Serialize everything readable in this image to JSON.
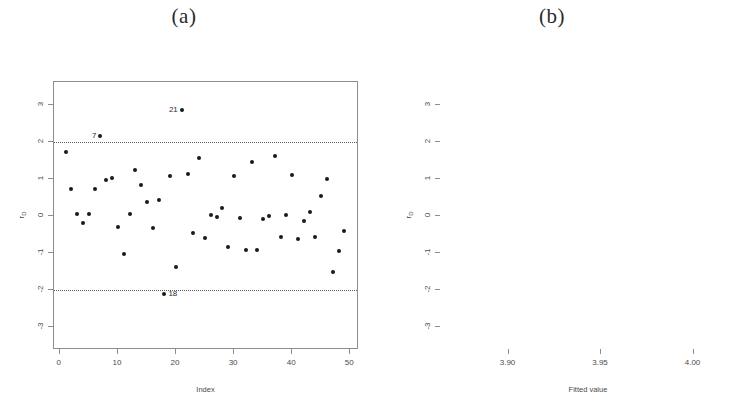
{
  "figure": {
    "panels": [
      {
        "id": "a",
        "title": "(a)"
      },
      {
        "id": "b",
        "title": "(b)"
      }
    ]
  },
  "chart_data": [
    {
      "type": "scatter",
      "panel": "(a)",
      "title": "(a)",
      "xlabel": "Index",
      "ylabel": "rD",
      "ylabel_base": "r",
      "ylabel_sub": "D",
      "xlim": [
        -1.0,
        51.5
      ],
      "ylim": [
        -3.62,
        3.62
      ],
      "xticks": [
        0,
        10,
        20,
        30,
        40,
        50
      ],
      "xticklabels": [
        "0",
        "10",
        "20",
        "30",
        "40",
        "50"
      ],
      "yticks": [
        3,
        2,
        1,
        0,
        -1,
        -2,
        -3
      ],
      "yticklabels": [
        "3",
        "2",
        "1",
        "0",
        "-1",
        "-2",
        "-3"
      ],
      "grid": false,
      "legend": null,
      "reference_lines": [
        {
          "y": 2.0,
          "style": "dotted"
        },
        {
          "y": -2.0,
          "style": "dotted"
        }
      ],
      "x": [
        1,
        2,
        3,
        4,
        5,
        6,
        7,
        8,
        9,
        10,
        11,
        12,
        13,
        14,
        15,
        16,
        17,
        18,
        19,
        20,
        21,
        22,
        23,
        24,
        25,
        26,
        27,
        28,
        29,
        30,
        31,
        32,
        33,
        34,
        35,
        36,
        37,
        38,
        39,
        40,
        41,
        42,
        43,
        44,
        45,
        46,
        47,
        48,
        49
      ],
      "values": [
        1.74,
        0.73,
        0.05,
        -0.18,
        0.05,
        0.74,
        2.16,
        0.97,
        1.02,
        -0.29,
        -1.03,
        0.05,
        1.25,
        0.84,
        0.37,
        -0.33,
        0.44,
        -2.11,
        1.07,
        -1.37,
        2.86,
        1.13,
        -0.45,
        1.56,
        -0.6,
        0.03,
        -0.03,
        0.22,
        -0.85,
        1.07,
        -0.06,
        -0.92,
        1.47,
        -0.91,
        -0.08,
        0.0,
        1.61,
        -0.57,
        0.02,
        1.1,
        -0.63,
        -0.14,
        0.1,
        -0.58,
        0.53,
        1.01,
        -1.52,
        -0.95,
        -0.41
      ],
      "annotations": [
        {
          "label": "7",
          "x": 7,
          "y": 2.16,
          "align": "left"
        },
        {
          "label": "18",
          "x": 18,
          "y": -2.11,
          "align": "right"
        },
        {
          "label": "21",
          "x": 21,
          "y": 2.86,
          "align": "left"
        }
      ]
    },
    {
      "type": "scatter",
      "panel": "(b)",
      "title": "(b)",
      "xlabel": "Fitted value",
      "ylabel": "rD",
      "ylabel_base": "r",
      "ylabel_sub": "D",
      "xlim": [
        3.8635,
        4.0235
      ],
      "ylim": [
        -3.62,
        3.62
      ],
      "xticks": [
        3.9,
        3.95,
        4.0
      ],
      "xticklabels": [
        "3.90",
        "3.95",
        "4.00"
      ],
      "yticks": [
        3,
        2,
        1,
        0,
        -1,
        -2,
        -3
      ],
      "yticklabels": [
        "3",
        "2",
        "1",
        "0",
        "-1",
        "-2",
        "-3"
      ],
      "grid": false,
      "legend": null,
      "reference_lines": [
        {
          "y": 2.0,
          "style": "dotted"
        },
        {
          "y": -2.0,
          "style": "dotted"
        }
      ],
      "x": [
        3.8655,
        3.8695,
        3.87,
        3.8712,
        3.8722,
        3.8745,
        3.876,
        3.8775,
        3.8785,
        3.88,
        3.886,
        3.9082,
        3.9098,
        3.911,
        3.912,
        3.9128,
        3.919,
        3.924,
        3.9248,
        3.925,
        3.93,
        3.9352,
        3.94,
        3.9405,
        3.9412,
        3.9498,
        3.9505,
        3.9512,
        3.952,
        3.9558,
        3.957,
        3.9585,
        3.96,
        3.964,
        3.97,
        3.9748,
        3.9855,
        3.995,
        3.9958,
        3.9962,
        3.9975,
        4.0,
        4.0005,
        4.001,
        4.004,
        4.0055,
        4.0068,
        4.0082,
        4.012
      ],
      "values": [
        0.05,
        1.48,
        -0.85,
        1.25,
        -1.52,
        1.74,
        -0.63,
        -1.37,
        0.74,
        -0.91,
        2.86,
        2.16,
        -0.14,
        -0.08,
        -0.06,
        -0.33,
        -1.03,
        1.56,
        1.13,
        0.1,
        0.73,
        1.02,
        0.37,
        0.02,
        -0.95,
        0.73,
        1.61,
        0.53,
        -0.6,
        1.07,
        -0.92,
        0.03,
        -0.03,
        -0.41,
        -0.29,
        1.47,
        0.44,
        0.97,
        0.02,
        -2.11,
        -0.57,
        1.0,
        -0.18,
        1.07,
        0.84,
        -0.45,
        1.1,
        0.22,
        0.05
      ],
      "annotations": []
    }
  ]
}
